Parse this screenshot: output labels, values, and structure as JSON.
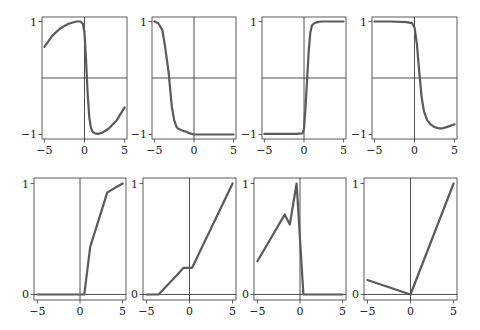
{
  "figure": {
    "width": 480,
    "height": 330,
    "line_color": "#5a5a5a",
    "axis_color": "#222222",
    "frame_color": "#333333"
  },
  "chart_data": [
    {
      "type": "line",
      "panel": "top-1",
      "title": "",
      "xlabel": "",
      "ylabel": "",
      "xlim": [
        -5.3,
        5.3
      ],
      "ylim": [
        -1.08,
        1.08
      ],
      "xticks": [
        -5,
        0,
        5
      ],
      "xtick_labels": [
        "−5",
        "0",
        "5"
      ],
      "yticks": [
        -1,
        1
      ],
      "ytick_labels": [
        "−1",
        "1"
      ],
      "grid": false,
      "frame": {
        "x0": 42,
        "x1": 127,
        "y0": 17,
        "y1": 139
      },
      "x": [
        -5,
        -4,
        -3,
        -2,
        -1,
        -0.5,
        -0.2,
        0,
        0.2,
        0.4,
        0.6,
        0.8,
        1.0,
        1.3,
        1.7,
        2.2,
        3,
        4,
        5
      ],
      "y": [
        0.55,
        0.75,
        0.88,
        0.96,
        1.0,
        1.0,
        0.96,
        0.8,
        0.3,
        -0.3,
        -0.7,
        -0.88,
        -0.95,
        -0.98,
        -0.99,
        -0.97,
        -0.9,
        -0.75,
        -0.52
      ]
    },
    {
      "type": "line",
      "panel": "top-2",
      "xlim": [
        -5.3,
        5.3
      ],
      "ylim": [
        -1.08,
        1.08
      ],
      "xticks": [
        -5,
        0,
        5
      ],
      "xtick_labels": [
        "−5",
        "0",
        "5"
      ],
      "yticks": [
        -1,
        1
      ],
      "ytick_labels": [
        "−1",
        "1"
      ],
      "grid": false,
      "frame": {
        "x0": 152,
        "x1": 236,
        "y0": 17,
        "y1": 139
      },
      "x": [
        -5,
        -4.5,
        -4,
        -3.7,
        -3.4,
        -3.2,
        -3,
        -2.8,
        -2.5,
        -2.2,
        -2,
        -1.5,
        -1,
        -0.5,
        0,
        1,
        2,
        3,
        4,
        5
      ],
      "y": [
        1.0,
        0.97,
        0.85,
        0.6,
        0.3,
        0.1,
        -0.2,
        -0.5,
        -0.75,
        -0.87,
        -0.9,
        -0.93,
        -0.95,
        -0.98,
        -1.0,
        -1.0,
        -1.0,
        -1.0,
        -1.0,
        -1.0
      ]
    },
    {
      "type": "line",
      "panel": "top-3",
      "xlim": [
        -5.3,
        5.3
      ],
      "ylim": [
        -1.08,
        1.08
      ],
      "xticks": [
        -5,
        0,
        5
      ],
      "xtick_labels": [
        "−5",
        "0",
        "5"
      ],
      "yticks": [
        -1,
        1
      ],
      "ytick_labels": [
        "−1",
        "1"
      ],
      "grid": false,
      "frame": {
        "x0": 262,
        "x1": 346,
        "y0": 17,
        "y1": 139
      },
      "x": [
        -5,
        -3,
        -1,
        -0.2,
        0,
        0.2,
        0.4,
        0.6,
        0.8,
        1.0,
        1.3,
        1.7,
        2.2,
        3,
        4,
        5
      ],
      "y": [
        -0.99,
        -0.99,
        -0.99,
        -0.98,
        -0.9,
        -0.5,
        0.0,
        0.5,
        0.8,
        0.93,
        0.97,
        0.99,
        1.0,
        1.0,
        1.0,
        1.0
      ]
    },
    {
      "type": "line",
      "panel": "top-4",
      "xlim": [
        -5.3,
        5.3
      ],
      "ylim": [
        -1.08,
        1.08
      ],
      "xticks": [
        -5,
        0,
        5
      ],
      "xtick_labels": [
        "−5",
        "0",
        "5"
      ],
      "yticks": [
        -1,
        1
      ],
      "ytick_labels": [
        "−1",
        "1"
      ],
      "grid": false,
      "frame": {
        "x0": 372,
        "x1": 457,
        "y0": 17,
        "y1": 139
      },
      "x": [
        -5,
        -3,
        -1,
        -0.3,
        0,
        0.3,
        0.6,
        0.9,
        1.2,
        1.6,
        2,
        2.5,
        3,
        3.5,
        4,
        5
      ],
      "y": [
        1.0,
        1.0,
        0.99,
        0.97,
        0.9,
        0.6,
        0.1,
        -0.35,
        -0.6,
        -0.75,
        -0.82,
        -0.87,
        -0.89,
        -0.89,
        -0.87,
        -0.82
      ]
    },
    {
      "type": "line",
      "panel": "bottom-1",
      "xlim": [
        -5.4,
        5.4
      ],
      "ylim": [
        -0.05,
        1.05
      ],
      "xticks": [
        -5,
        0,
        5
      ],
      "xtick_labels": [
        "−5",
        "0",
        "5"
      ],
      "yticks": [
        0,
        1
      ],
      "ytick_labels": [
        "0",
        "1"
      ],
      "grid": false,
      "frame": {
        "x0": 34,
        "x1": 126,
        "y0": 178,
        "y1": 300
      },
      "x": [
        -5,
        0,
        0.5,
        1.2,
        3.2,
        5
      ],
      "y": [
        0,
        0,
        0,
        0.43,
        0.92,
        1.0
      ]
    },
    {
      "type": "line",
      "panel": "bottom-2",
      "xlim": [
        -5.4,
        5.4
      ],
      "ylim": [
        -0.05,
        1.05
      ],
      "xticks": [
        -5,
        0,
        5
      ],
      "xtick_labels": [
        "−5",
        "0",
        "5"
      ],
      "yticks": [
        0,
        1
      ],
      "ytick_labels": [
        "0",
        "1"
      ],
      "grid": false,
      "frame": {
        "x0": 143,
        "x1": 236,
        "y0": 178,
        "y1": 300
      },
      "x": [
        -5,
        -3.6,
        -1.5,
        -0.7,
        0.3,
        5
      ],
      "y": [
        0,
        0,
        0.17,
        0.24,
        0.24,
        1.0
      ]
    },
    {
      "type": "line",
      "panel": "bottom-3",
      "xlim": [
        -5.4,
        5.4
      ],
      "ylim": [
        -0.05,
        1.05
      ],
      "xticks": [
        -5,
        0,
        5
      ],
      "xtick_labels": [
        "−5",
        "0",
        "5"
      ],
      "yticks": [
        0,
        1
      ],
      "ytick_labels": [
        "0",
        "1"
      ],
      "grid": false,
      "frame": {
        "x0": 254,
        "x1": 346,
        "y0": 178,
        "y1": 300
      },
      "x": [
        -5,
        -1.8,
        -1.2,
        -0.4,
        0.4,
        5
      ],
      "y": [
        0.3,
        0.72,
        0.63,
        1.0,
        0,
        0
      ]
    },
    {
      "type": "line",
      "panel": "bottom-4",
      "xlim": [
        -5.4,
        5.4
      ],
      "ylim": [
        -0.05,
        1.05
      ],
      "xticks": [
        -5,
        0,
        5
      ],
      "xtick_labels": [
        "−5",
        "0",
        "5"
      ],
      "yticks": [
        0,
        1
      ],
      "ytick_labels": [
        "0",
        "1"
      ],
      "grid": false,
      "frame": {
        "x0": 364,
        "x1": 457,
        "y0": 178,
        "y1": 300
      },
      "x": [
        -5,
        0,
        5
      ],
      "y": [
        0.13,
        0,
        1.0
      ]
    }
  ]
}
